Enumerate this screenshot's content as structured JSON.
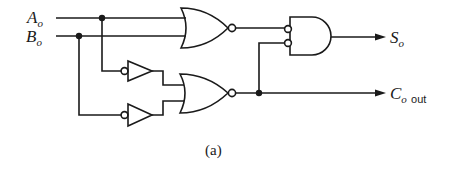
{
  "diagram": {
    "type": "logic-circuit",
    "caption": "(a)",
    "inputs": [
      {
        "id": "A",
        "main": "A",
        "sub": "o"
      },
      {
        "id": "B",
        "main": "B",
        "sub": "o"
      }
    ],
    "outputs": [
      {
        "id": "S",
        "main": "S",
        "sub": "o",
        "suffix": ""
      },
      {
        "id": "Cout",
        "main": "C",
        "sub": "o",
        "suffix": "out"
      }
    ],
    "gates": [
      {
        "id": "nor1",
        "type": "NOR",
        "inputs": [
          "A",
          "B"
        ]
      },
      {
        "id": "not1",
        "type": "NOT-input-bubble-buffer",
        "inputs": [
          "A"
        ]
      },
      {
        "id": "not2",
        "type": "NOT-input-bubble-buffer",
        "inputs": [
          "B"
        ]
      },
      {
        "id": "nor2",
        "type": "NOR",
        "inputs": [
          "not1",
          "not2"
        ]
      },
      {
        "id": "and1",
        "type": "AND-with-inverted-inputs",
        "inputs": [
          "nor1",
          "nor2"
        ]
      }
    ],
    "line_color": "#1a1a1a"
  }
}
